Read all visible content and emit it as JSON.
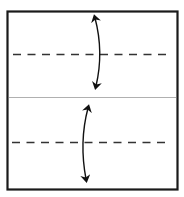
{
  "diagram": {
    "type": "origami-fold-diagram",
    "colors": {
      "border": "#1a1a1a",
      "crease": "#aaaaaa",
      "fold_line": "#333333",
      "arrow": "#111111"
    },
    "elements": {
      "paper": {
        "label": "paper-square"
      },
      "center_crease": {
        "label": "center-crease"
      },
      "upper_fold": {
        "label": "valley-fold-upper"
      },
      "lower_fold": {
        "label": "valley-fold-lower"
      },
      "upper_arrow": {
        "label": "fold-arrow-upper"
      },
      "lower_arrow": {
        "label": "fold-arrow-lower"
      }
    }
  }
}
